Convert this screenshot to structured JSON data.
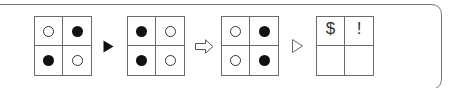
{
  "colors": {
    "frame": "#777777",
    "grid_line": "#6b6b6b",
    "filled_dot": "#111111",
    "hollow_dot_stroke": "#333333"
  },
  "sequence": [
    {
      "type": "grid",
      "cells": [
        "hollow",
        "filled",
        "filled",
        "hollow"
      ]
    },
    {
      "type": "connector",
      "icon": "filled-triangle-right"
    },
    {
      "type": "grid",
      "cells": [
        "filled",
        "hollow",
        "filled",
        "hollow"
      ]
    },
    {
      "type": "connector",
      "icon": "hollow-arrow-right"
    },
    {
      "type": "grid",
      "cells": [
        "hollow",
        "filled",
        "hollow",
        "filled"
      ]
    },
    {
      "type": "connector",
      "icon": "hollow-triangle-right"
    },
    {
      "type": "grid",
      "cells": [
        "$",
        "!",
        "",
        ""
      ]
    }
  ],
  "grid4": {
    "top_left": "$",
    "top_right": "!",
    "bottom_left": "",
    "bottom_right": ""
  }
}
